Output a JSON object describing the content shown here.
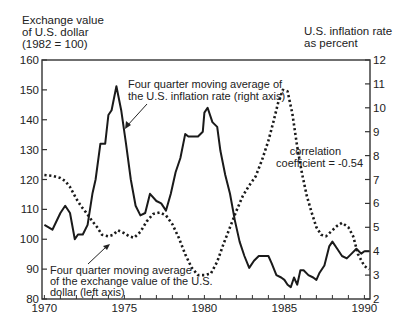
{
  "chart_data": {
    "type": "line",
    "title": "",
    "xlabel": "",
    "left_axis_label": [
      "Exchange value",
      "of U.S. dollar",
      "(1982 = 100)"
    ],
    "right_axis_label": [
      "U.S. inflation rate",
      "as percent"
    ],
    "x_ticks": [
      "1970",
      "1975",
      "1980",
      "1985",
      "1990"
    ],
    "left_ticks": [
      "160",
      "150",
      "140",
      "130",
      "120",
      "110",
      "100",
      "90",
      "80"
    ],
    "right_ticks": [
      "12",
      "11",
      "10",
      "9",
      "8",
      "7",
      "6",
      "5",
      "4",
      "3",
      "2"
    ],
    "xlim": [
      1969.85,
      1990.35
    ],
    "ylim_left": [
      80,
      160
    ],
    "ylim_right": [
      2,
      12
    ],
    "grid": false,
    "series": [
      {
        "name": "Four quarter moving average of the exchange value of the U.S. dollar (left axis)",
        "axis": "left",
        "style": "dotted",
        "x": [
          1970.0,
          1970.5,
          1971.0,
          1971.3,
          1971.6,
          1972.0,
          1972.3,
          1972.6,
          1973.0,
          1973.3,
          1973.6,
          1974.0,
          1974.3,
          1974.6,
          1975.0,
          1975.3,
          1975.6,
          1976.0,
          1976.4,
          1976.8,
          1977.2,
          1977.6,
          1978.0,
          1978.4,
          1978.8,
          1979.2,
          1979.6,
          1980.0,
          1980.4,
          1980.8,
          1981.2,
          1981.6,
          1982.0,
          1982.4,
          1982.8,
          1983.2,
          1983.6,
          1984.0,
          1984.3,
          1984.6,
          1984.9,
          1985.2,
          1985.5,
          1985.8,
          1986.1,
          1986.4,
          1986.7,
          1987.0,
          1987.3,
          1987.6,
          1988.0,
          1988.3,
          1988.6,
          1989.0,
          1989.3,
          1989.6,
          1990.0,
          1990.3
        ],
        "values": [
          121.5,
          121.2,
          120.5,
          119.5,
          117.5,
          113.5,
          111.0,
          109.0,
          106.0,
          104.0,
          101.5,
          101.0,
          101.5,
          103.0,
          102.0,
          101.0,
          100.5,
          102.5,
          106.0,
          108.5,
          109.0,
          108.0,
          105.0,
          100.5,
          95.0,
          90.5,
          88.0,
          88.0,
          88.5,
          92.5,
          98.5,
          104.0,
          109.5,
          114.5,
          118.0,
          121.0,
          126.5,
          133.0,
          139.0,
          145.5,
          150.0,
          149.5,
          142.0,
          131.0,
          122.0,
          114.5,
          109.0,
          104.0,
          101.5,
          101.0,
          103.0,
          104.5,
          105.5,
          104.0,
          101.0,
          95.0,
          91.0,
          90.0
        ]
      },
      {
        "name": "Four quarter moving average of the U.S. inflation rate (right axis)",
        "axis": "right",
        "style": "solid",
        "x": [
          1970.0,
          1970.5,
          1971.0,
          1971.3,
          1971.6,
          1971.9,
          1972.1,
          1972.4,
          1972.7,
          1973.0,
          1973.2,
          1973.5,
          1973.8,
          1974.0,
          1974.2,
          1974.5,
          1974.8,
          1975.1,
          1975.4,
          1975.7,
          1976.0,
          1976.3,
          1976.6,
          1977.0,
          1977.3,
          1977.6,
          1977.9,
          1978.2,
          1978.5,
          1978.8,
          1979.0,
          1979.3,
          1979.6,
          1979.9,
          1980.0,
          1980.2,
          1980.5,
          1980.8,
          1981.0,
          1981.3,
          1981.6,
          1981.9,
          1982.2,
          1982.5,
          1982.8,
          1983.1,
          1983.4,
          1983.7,
          1984.0,
          1984.2,
          1984.5,
          1984.8,
          1985.0,
          1985.2,
          1985.4,
          1985.6,
          1985.8,
          1986.0,
          1986.2,
          1986.5,
          1986.8,
          1987.0,
          1987.2,
          1987.5,
          1987.8,
          1988.0,
          1988.3,
          1988.6,
          1988.9,
          1989.2,
          1989.5,
          1989.8,
          1990.0,
          1990.3
        ],
        "values": [
          5.1,
          4.9,
          5.6,
          5.9,
          5.6,
          4.5,
          4.7,
          4.7,
          5.1,
          6.4,
          7.0,
          8.5,
          8.5,
          9.7,
          9.9,
          10.9,
          9.9,
          8.5,
          7.0,
          5.9,
          5.5,
          5.6,
          6.4,
          6.1,
          6.0,
          5.7,
          6.4,
          7.3,
          7.9,
          8.9,
          8.8,
          8.8,
          8.8,
          9.0,
          9.8,
          10.0,
          9.4,
          9.2,
          8.2,
          7.2,
          6.4,
          5.3,
          4.4,
          3.8,
          3.3,
          3.6,
          3.8,
          3.8,
          3.8,
          3.5,
          3.0,
          2.9,
          2.8,
          2.6,
          2.5,
          2.9,
          2.6,
          3.2,
          3.2,
          3.0,
          2.9,
          2.8,
          3.1,
          3.4,
          4.2,
          4.4,
          4.1,
          3.8,
          3.7,
          3.9,
          4.1,
          3.9,
          4.0,
          4.0
        ]
      }
    ],
    "annotations": [
      {
        "text": [
          "Four quarter moving average of",
          "the U.S. inflation rate (right axis)"
        ]
      },
      {
        "text": [
          "Four quarter moving average",
          "of the exchange value of the U.S.",
          "dollar (left axis)"
        ]
      },
      {
        "text": [
          "correlation",
          "coefficient = -0.54"
        ]
      }
    ],
    "legend": "none (inline annotations with arrows)"
  },
  "labels": {
    "left_axis": [
      "Exchange value",
      "of U.S. dollar",
      "(1982 = 100)"
    ],
    "right_axis": [
      "U.S. inflation rate",
      "as percent"
    ],
    "inflation_note": [
      "Four quarter moving average of",
      "the U.S. inflation rate (right axis)"
    ],
    "dollar_note": [
      "Four quarter moving average",
      "of the exchange value of the U.S.",
      "dollar (left axis)"
    ],
    "correlation_note": [
      "correlation",
      "coefficient = -0.54"
    ]
  }
}
